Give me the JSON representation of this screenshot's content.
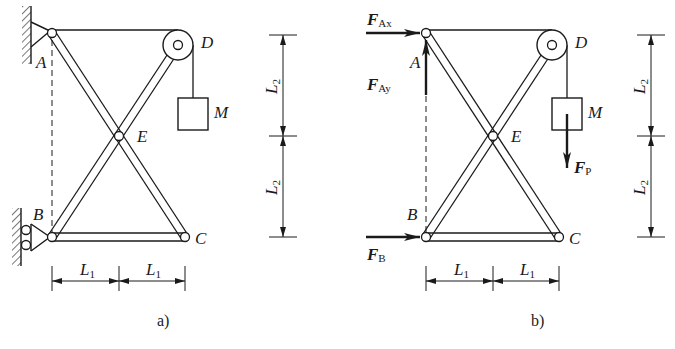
{
  "figure": {
    "panels": [
      {
        "id": "a",
        "caption": "a)",
        "points": {
          "A": "A",
          "B": "B",
          "C": "C",
          "D": "D",
          "E": "E"
        },
        "mass_label": "M",
        "dimensions": {
          "horizontal": [
            {
              "symbol": "L",
              "sub": "1"
            },
            {
              "symbol": "L",
              "sub": "1"
            }
          ],
          "vertical": [
            {
              "symbol": "L",
              "sub": "2"
            },
            {
              "symbol": "L",
              "sub": "2"
            }
          ]
        }
      },
      {
        "id": "b",
        "caption": "b)",
        "points": {
          "A": "A",
          "B": "B",
          "C": "C",
          "D": "D",
          "E": "E"
        },
        "mass_label": "M",
        "forces": {
          "FAx": {
            "symbol": "F",
            "sub": "Ax"
          },
          "FAy": {
            "symbol": "F",
            "sub": "Ay"
          },
          "FB": {
            "symbol": "F",
            "sub": "B"
          },
          "FP": {
            "symbol": "F",
            "sub": "P"
          }
        },
        "dimensions": {
          "horizontal": [
            {
              "symbol": "L",
              "sub": "1"
            },
            {
              "symbol": "L",
              "sub": "1"
            }
          ],
          "vertical": [
            {
              "symbol": "L",
              "sub": "2"
            },
            {
              "symbol": "L",
              "sub": "2"
            }
          ]
        }
      }
    ],
    "colors": {
      "ink": "#1a1a1a",
      "background": "#ffffff"
    }
  }
}
